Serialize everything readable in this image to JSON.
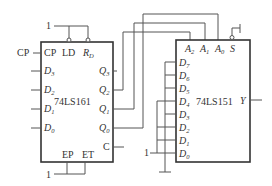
{
  "diagram": {
    "type": "logic-circuit",
    "counter": {
      "chip": "74LS161",
      "top_pins": {
        "ld": "LD",
        "rd": "R",
        "rd_sub": "D"
      },
      "clock_pin": "CP",
      "clock_input_label": "CP",
      "data_inputs": [
        {
          "name": "D",
          "sub": "3"
        },
        {
          "name": "D",
          "sub": "2"
        },
        {
          "name": "D",
          "sub": "1"
        },
        {
          "name": "D",
          "sub": "0"
        }
      ],
      "outputs": [
        {
          "name": "Q",
          "sub": "3"
        },
        {
          "name": "Q",
          "sub": "2"
        },
        {
          "name": "Q",
          "sub": "1"
        },
        {
          "name": "Q",
          "sub": "0"
        }
      ],
      "carry_output": "C",
      "bottom_pins": {
        "ep": "EP",
        "et": "ET"
      },
      "top_constant": "1",
      "bottom_constant": "1"
    },
    "mux": {
      "chip": "74LS151",
      "select_pins": [
        {
          "name": "A",
          "sub": "2"
        },
        {
          "name": "A",
          "sub": "1"
        },
        {
          "name": "A",
          "sub": "0"
        }
      ],
      "strobe_pin": "S",
      "data_inputs": [
        {
          "name": "D",
          "sub": "7"
        },
        {
          "name": "D",
          "sub": "6"
        },
        {
          "name": "D",
          "sub": "5"
        },
        {
          "name": "D",
          "sub": "4"
        },
        {
          "name": "D",
          "sub": "3"
        },
        {
          "name": "D",
          "sub": "2"
        },
        {
          "name": "D",
          "sub": "1"
        },
        {
          "name": "D",
          "sub": "0"
        }
      ],
      "output": "Y",
      "input_constant": "1"
    },
    "connections": [
      "Q2 -> A2",
      "Q1 -> A1",
      "Q0 -> A0",
      "S -> ground (active low)",
      "1 -> LD, RD",
      "1 -> EP, ET"
    ],
    "colors": {
      "line": "#555555",
      "text": "#333333",
      "background": "#ffffff"
    }
  }
}
